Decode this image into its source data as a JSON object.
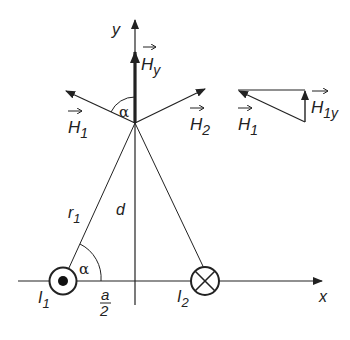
{
  "diagram": {
    "axes": {
      "x_label": "x",
      "y_label": "y"
    },
    "currents": [
      {
        "name": "I",
        "sub": "1",
        "direction": "out-of-page (dot)"
      },
      {
        "name": "I",
        "sub": "2",
        "direction": "into-page (cross)"
      }
    ],
    "vectors": {
      "H1": {
        "name": "H",
        "sub": "1"
      },
      "H2": {
        "name": "H",
        "sub": "2"
      },
      "Hy": {
        "name": "H",
        "sub": "y"
      },
      "H1y": {
        "name": "H",
        "sub": "1y"
      }
    },
    "labels": {
      "r1_name": "r",
      "r1_sub": "1",
      "d": "d",
      "alpha": "α",
      "a_num": "a",
      "a_den": "2"
    },
    "colors": {
      "ink": "#222222",
      "background": "#ffffff"
    }
  }
}
